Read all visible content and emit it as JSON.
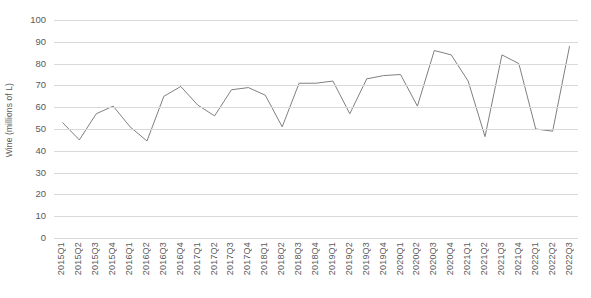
{
  "chart_data": {
    "type": "line",
    "title": "",
    "xlabel": "",
    "ylabel": "Wine (millions of L)",
    "ylim": [
      0,
      100
    ],
    "ytick_step": 10,
    "yticks": [
      100,
      90,
      80,
      70,
      60,
      50,
      40,
      30,
      20,
      10,
      0
    ],
    "grid": true,
    "legend": "none",
    "line_color": "#808080",
    "categories": [
      "2015Q1",
      "2015Q2",
      "2015Q3",
      "2015Q4",
      "2016Q1",
      "2016Q2",
      "2016Q3",
      "2016Q4",
      "2017Q1",
      "2017Q2",
      "2017Q3",
      "2017Q4",
      "2018Q1",
      "2018Q2",
      "2018Q3",
      "2018Q4",
      "2019Q1",
      "2019Q2",
      "2019Q3",
      "2019Q4",
      "2020Q1",
      "2020Q2",
      "2020Q3",
      "2020Q4",
      "2021Q1",
      "2021Q2",
      "2021Q3",
      "2021Q4",
      "2022Q1",
      "2022Q2",
      "2022Q3"
    ],
    "values": [
      53,
      45,
      57,
      60.5,
      51,
      44.5,
      65,
      69.5,
      61,
      56,
      68,
      69,
      65.5,
      51,
      71,
      71,
      72,
      57,
      73,
      74.5,
      75,
      60.5,
      86,
      84,
      72,
      46.5,
      84,
      80,
      50,
      49,
      88
    ]
  }
}
